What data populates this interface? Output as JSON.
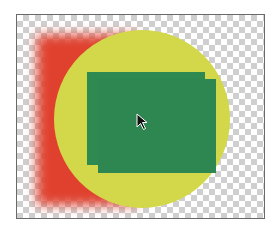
{
  "canvas": {
    "background": "transparent-checkerboard",
    "frame_border_color": "#6a6a6a",
    "checker_color": "#cfcfcf"
  },
  "shapes": [
    {
      "name": "red-square",
      "type": "rectangle",
      "color": "#e0402e",
      "effect": "feathered-blur"
    },
    {
      "name": "yellow-circle",
      "type": "circle",
      "color": "#d2d84a"
    },
    {
      "name": "green-rect-back",
      "type": "rectangle",
      "color": "#2f8a52"
    },
    {
      "name": "green-rect-front",
      "type": "rectangle",
      "color": "#2f8a52"
    }
  ],
  "cursor": {
    "icon": "arrow-pointer-icon"
  }
}
